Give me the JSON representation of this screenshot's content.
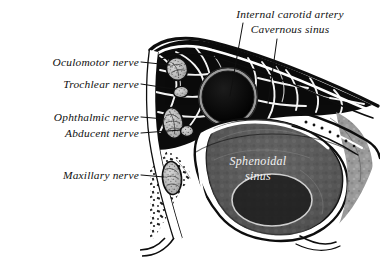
{
  "figure": {
    "background_color": "#ffffff",
    "ink_color": "#101010",
    "inset_label_color": "#f2f2f2"
  },
  "labels": {
    "left": [
      {
        "id": "oculomotor",
        "text": "Oculomotor nerve",
        "x": 139,
        "y": 65,
        "leader_to_x": 172,
        "leader_to_y": 68
      },
      {
        "id": "trochlear",
        "text": "Trochlear nerve",
        "x": 139,
        "y": 87,
        "leader_to_x": 176,
        "leader_to_y": 91
      },
      {
        "id": "ophthalmic",
        "text": "Ophthalmic nerve",
        "x": 139,
        "y": 120,
        "leader_to_x": 168,
        "leader_to_y": 122
      },
      {
        "id": "abducent",
        "text": "Abducent nerve",
        "x": 139,
        "y": 136,
        "leader_to_x": 180,
        "leader_to_y": 131
      },
      {
        "id": "maxillary",
        "text": "Maxillary nerve",
        "x": 139,
        "y": 178,
        "leader_to_x": 168,
        "leader_to_y": 180
      }
    ],
    "top": [
      {
        "id": "internal-carotid-artery",
        "text": "Internal carotid artery",
        "x": 290,
        "y": 17,
        "leader_from_x": 243,
        "leader_from_y": 22,
        "leader_to_x": 229,
        "leader_to_y": 95
      },
      {
        "id": "cavernous-sinus",
        "text": "Cavernous sinus",
        "x": 290,
        "y": 32,
        "leader_from_x": 277,
        "leader_from_y": 38,
        "leader_to_x": 268,
        "leader_to_y": 103
      }
    ],
    "inset": [
      {
        "id": "sphenoidal-sinus",
        "line1": "Sphenoidal",
        "line2": "sinus",
        "x": 258,
        "y": 165
      }
    ]
  },
  "structures": {
    "carotid": {
      "cx": 228,
      "cy": 97,
      "r_outer": 29,
      "r_inner": 25
    },
    "nerves": [
      {
        "id": "oculomotor-oval",
        "cx": 177,
        "cy": 69,
        "rx": 10,
        "ry": 11,
        "rot": -20
      },
      {
        "id": "trochlear-oval",
        "cx": 180,
        "cy": 92,
        "rx": 7,
        "ry": 5,
        "rot": -10
      },
      {
        "id": "ophthalmic-oval",
        "cx": 173,
        "cy": 123,
        "rx": 10,
        "ry": 15,
        "rot": -8
      },
      {
        "id": "abducent-oval",
        "cx": 186,
        "cy": 131,
        "rx": 6,
        "ry": 5,
        "rot": 0
      },
      {
        "id": "maxillary-oval",
        "cx": 172,
        "cy": 178,
        "rx": 9,
        "ry": 16,
        "rot": -5
      }
    ]
  }
}
